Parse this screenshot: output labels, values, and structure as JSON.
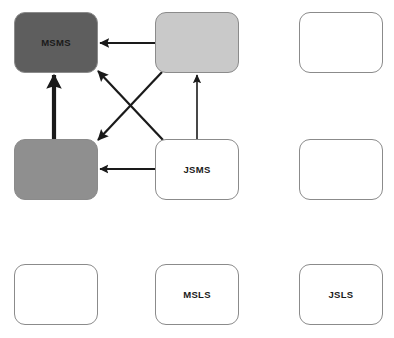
{
  "diagram": {
    "title": "",
    "type": "grid-graph",
    "canvas": {
      "width": 394,
      "height": 338,
      "background": "#ffffff"
    },
    "palette": {
      "dark_gray": "#5e5e5e",
      "mid_gray": "#8f8f8f",
      "light_gray": "#c9c9c9",
      "white": "#ffffff",
      "border": "#8b8b8b",
      "edge": "#1a1a1a",
      "label": "#1a1a1a"
    },
    "nodes": [
      {
        "id": "r1c1",
        "label": "MSMS",
        "fill": "#5e5e5e",
        "x": 14,
        "y": 12,
        "w": 84,
        "h": 61
      },
      {
        "id": "r1c2",
        "label": "",
        "fill": "#c9c9c9",
        "x": 155,
        "y": 12,
        "w": 84,
        "h": 61
      },
      {
        "id": "r1c3",
        "label": "",
        "fill": "#ffffff",
        "x": 299,
        "y": 12,
        "w": 84,
        "h": 61
      },
      {
        "id": "r2c1",
        "label": "",
        "fill": "#8f8f8f",
        "x": 14,
        "y": 139,
        "w": 84,
        "h": 61
      },
      {
        "id": "r2c2",
        "label": "JSMS",
        "fill": "#ffffff",
        "x": 155,
        "y": 139,
        "w": 84,
        "h": 61
      },
      {
        "id": "r2c3",
        "label": "",
        "fill": "#ffffff",
        "x": 299,
        "y": 139,
        "w": 84,
        "h": 61
      },
      {
        "id": "r3c1",
        "label": "",
        "fill": "#ffffff",
        "x": 14,
        "y": 264,
        "w": 84,
        "h": 61
      },
      {
        "id": "r3c2",
        "label": "MSLS",
        "fill": "#ffffff",
        "x": 155,
        "y": 264,
        "w": 84,
        "h": 61
      },
      {
        "id": "r3c3",
        "label": "JSLS",
        "fill": "#ffffff",
        "x": 299,
        "y": 264,
        "w": 84,
        "h": 61
      }
    ],
    "edges": [
      {
        "id": "e1",
        "from": "r1c2",
        "to": "r1c1",
        "x1": 155,
        "y1": 43,
        "x2": 100,
        "y2": 43,
        "width": 2.0,
        "head": "medium"
      },
      {
        "id": "e2",
        "from": "r2c1",
        "to": "r1c1",
        "x1": 54,
        "y1": 139,
        "x2": 54,
        "y2": 75,
        "width": 4.2,
        "head": "large"
      },
      {
        "id": "e3",
        "from": "r2c2",
        "to": "r1c2",
        "x1": 197,
        "y1": 139,
        "x2": 197,
        "y2": 75,
        "width": 1.6,
        "head": "small"
      },
      {
        "id": "e4",
        "from": "r2c2",
        "to": "r2c1",
        "x1": 162,
        "y1": 169,
        "x2": 100,
        "y2": 169,
        "width": 1.8,
        "head": "medium"
      },
      {
        "id": "e5",
        "from": "r2c2",
        "to": "r1c1",
        "x1": 163,
        "y1": 140,
        "x2": 98,
        "y2": 71,
        "width": 2.2,
        "head": "medium"
      },
      {
        "id": "e6",
        "from": "r1c2",
        "to": "r2c1",
        "x1": 162,
        "y1": 72,
        "x2": 98,
        "y2": 140,
        "width": 2.2,
        "head": "medium"
      }
    ]
  }
}
